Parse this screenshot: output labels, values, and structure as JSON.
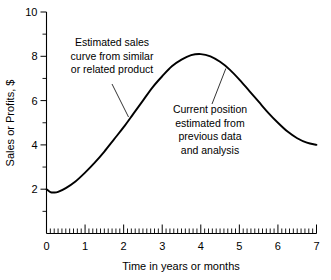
{
  "chart_data": {
    "type": "line",
    "title": "",
    "xlabel": "Time in years or months",
    "ylabel": "Sales or Profits, $",
    "xlim": [
      0,
      7
    ],
    "ylim": [
      0,
      10
    ],
    "grid": false,
    "legend": "none",
    "x_major_ticks": [
      "0",
      "1",
      "2",
      "3",
      "4",
      "5",
      "6",
      "7"
    ],
    "y_major_ticks": [
      "2",
      "4",
      "6",
      "8",
      "10"
    ],
    "x_minor_per_unit": 10,
    "y_minor_per_unit": 1,
    "series": [
      {
        "name": "Estimated sales curve",
        "x": [
          0.0,
          0.1,
          0.2,
          0.3,
          0.5,
          0.75,
          1.0,
          1.25,
          1.5,
          1.75,
          2.0,
          2.25,
          2.5,
          2.75,
          3.0,
          3.25,
          3.5,
          3.75,
          4.0,
          4.25,
          4.5,
          4.75,
          5.0,
          5.25,
          5.5,
          5.75,
          6.0,
          6.25,
          6.5,
          6.75,
          7.0
        ],
        "values": [
          2.0,
          1.87,
          1.85,
          1.88,
          2.05,
          2.35,
          2.75,
          3.2,
          3.7,
          4.25,
          4.8,
          5.4,
          6.0,
          6.6,
          7.1,
          7.55,
          7.85,
          8.05,
          8.1,
          8.0,
          7.75,
          7.4,
          6.95,
          6.45,
          5.95,
          5.45,
          5.0,
          4.6,
          4.3,
          4.1,
          4.0
        ]
      }
    ],
    "annotations": [
      {
        "id": "estimated-sales-curve",
        "lines": [
          "Estimated sales",
          "curve from similar",
          "or related product"
        ],
        "target_x": 2.3,
        "target_y": 5.05
      },
      {
        "id": "current-position",
        "lines": [
          "Current position",
          "estimated from",
          "previous data",
          "and analysis"
        ],
        "target_x": 4.65,
        "target_y": 7.45
      }
    ]
  }
}
